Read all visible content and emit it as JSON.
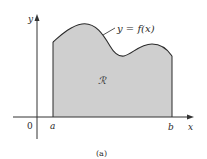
{
  "diagram": {
    "caption": "(a)",
    "curve_label": "y = f(x)",
    "region_label": "ℛ",
    "axes": {
      "y_label": "y",
      "x_label": "x",
      "origin_label": "0"
    },
    "bounds": {
      "left_label": "a",
      "right_label": "b"
    },
    "colors": {
      "region_fill": "#cfcfcf",
      "curve": "#2b2b2b",
      "axis": "#333333"
    }
  }
}
